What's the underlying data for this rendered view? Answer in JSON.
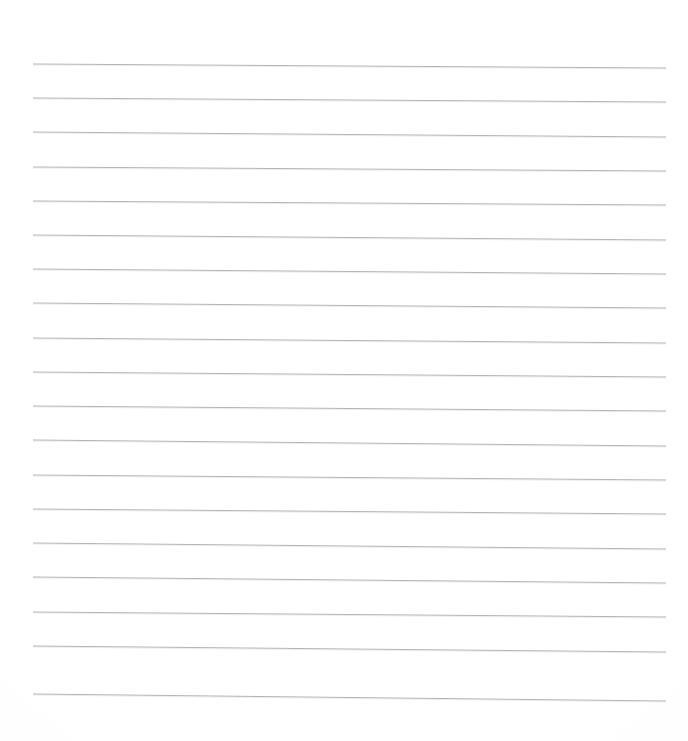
{
  "document": {
    "kind": "lined-notebook-paper",
    "title": "Blank lined paper sheet",
    "description": "A blank sheet of ruled writing paper with evenly spaced horizontal lines and no written content.",
    "page_width_px": 688,
    "page_height_px": 741,
    "background_color": "#fefefe",
    "paper_tint_color": "#fcfcfc",
    "has_text": false,
    "has_margin_rule": false,
    "visible_text": ""
  },
  "ruling": {
    "line_color": "#b4b4b4",
    "line_color_faint": "#cfcfcf",
    "line_thickness_px": 1,
    "line_count": 19,
    "left_x_px": 33,
    "right_x_px": 666,
    "first_line_y_px": 64,
    "line_spacing_px": 34.2,
    "tilt_drop_px": 5,
    "orientation": "horizontal",
    "lines": [
      {
        "index": 1,
        "y_left": 64,
        "y_right": 68
      },
      {
        "index": 2,
        "y_left": 98,
        "y_right": 102
      },
      {
        "index": 3,
        "y_left": 132,
        "y_right": 137
      },
      {
        "index": 4,
        "y_left": 167,
        "y_right": 171
      },
      {
        "index": 5,
        "y_left": 201,
        "y_right": 205
      },
      {
        "index": 6,
        "y_left": 235,
        "y_right": 240
      },
      {
        "index": 7,
        "y_left": 269,
        "y_right": 274
      },
      {
        "index": 8,
        "y_left": 303,
        "y_right": 308
      },
      {
        "index": 9,
        "y_left": 338,
        "y_right": 343
      },
      {
        "index": 10,
        "y_left": 372,
        "y_right": 377
      },
      {
        "index": 11,
        "y_left": 406,
        "y_right": 411
      },
      {
        "index": 12,
        "y_left": 440,
        "y_right": 446
      },
      {
        "index": 13,
        "y_left": 475,
        "y_right": 480
      },
      {
        "index": 14,
        "y_left": 509,
        "y_right": 514
      },
      {
        "index": 15,
        "y_left": 543,
        "y_right": 549
      },
      {
        "index": 16,
        "y_left": 577,
        "y_right": 583
      },
      {
        "index": 17,
        "y_left": 612,
        "y_right": 617
      },
      {
        "index": 18,
        "y_left": 646,
        "y_right": 652
      },
      {
        "index": 19,
        "y_left": 694,
        "y_right": 701
      }
    ]
  }
}
